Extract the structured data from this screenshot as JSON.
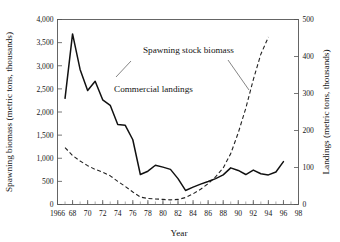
{
  "chart_data": {
    "type": "line",
    "title": "",
    "xlabel": "Year",
    "ylabel": "Spawning biomass (metric tons, thousands)",
    "y2label": "Landings (metric tons, thousands)",
    "xlim": [
      1966,
      1998
    ],
    "ylim": [
      0,
      4000
    ],
    "y2lim": [
      0,
      500
    ],
    "grid": false,
    "legend_position": "inline-annotations",
    "xticks": [
      1966,
      68,
      70,
      72,
      74,
      76,
      78,
      80,
      82,
      84,
      86,
      88,
      90,
      92,
      94,
      96,
      98
    ],
    "xtick_labels": [
      "1966",
      "68",
      "70",
      "72",
      "74",
      "76",
      "78",
      "80",
      "82",
      "84",
      "86",
      "88",
      "90",
      "92",
      "94",
      "96",
      "98"
    ],
    "yticks": [
      0,
      500,
      1000,
      1500,
      2000,
      2500,
      3000,
      3500,
      4000
    ],
    "ytick_labels": [
      "0",
      "500",
      "1,000",
      "1,500",
      "2,000",
      "2,500",
      "3,000",
      "3,500",
      "4,000"
    ],
    "y2ticks": [
      0,
      100,
      200,
      300,
      400,
      500
    ],
    "y2tick_labels": [
      "0",
      "100",
      "200",
      "300",
      "400",
      "500"
    ],
    "minor_tick_interval_x": 1,
    "annotations": [
      {
        "text": "Spawning stock biomass",
        "x": 1983.0,
        "y": 3350,
        "axis": "left"
      },
      {
        "text": "Commercial landings",
        "x": 1975.5,
        "y": 2600,
        "axis": "left"
      }
    ],
    "series": [
      {
        "name": "Commercial landings",
        "style": "solid",
        "axis": "right",
        "color": "#111111",
        "x": [
          1967,
          1968,
          1969,
          1970,
          1971,
          1972,
          1973,
          1974,
          1975,
          1976,
          1977,
          1978,
          1979,
          1980,
          1981,
          1982,
          1983,
          1984,
          1985,
          1986,
          1987,
          1988,
          1989,
          1990,
          1991,
          1992,
          1993,
          1994,
          1995,
          1996
        ],
        "values": [
          287,
          461,
          365,
          308,
          333,
          283,
          268,
          216,
          214,
          175,
          81,
          90,
          106,
          101,
          95,
          70,
          38,
          47,
          55,
          62,
          70,
          80,
          99,
          92,
          81,
          93,
          83,
          80,
          88,
          116
        ]
      },
      {
        "name": "Spawning stock biomass",
        "style": "dashed",
        "axis": "left",
        "color": "#222222",
        "x": [
          1967,
          1968,
          1969,
          1970,
          1971,
          1972,
          1973,
          1974,
          1975,
          1976,
          1977,
          1978,
          1979,
          1980,
          1981,
          1982,
          1983,
          1984,
          1985,
          1986,
          1987,
          1988,
          1989,
          1990,
          1991,
          1992,
          1993,
          1994
        ],
        "values": [
          1230,
          1060,
          940,
          840,
          760,
          700,
          620,
          500,
          390,
          270,
          160,
          130,
          120,
          110,
          100,
          110,
          150,
          230,
          330,
          450,
          600,
          790,
          1100,
          1550,
          2080,
          2700,
          3250,
          3620
        ]
      }
    ]
  }
}
